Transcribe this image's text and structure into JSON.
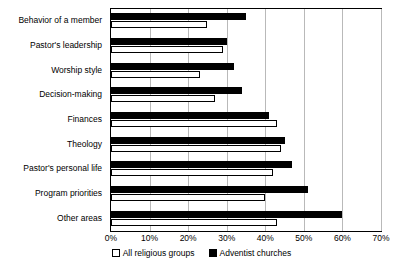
{
  "chart_data": {
    "type": "bar",
    "title": "",
    "xlabel": "",
    "ylabel": "",
    "orientation": "horizontal",
    "grid": true,
    "legend_position": "bottom",
    "xlim": [
      0,
      70
    ],
    "xticks": [
      "0%",
      "10%",
      "20%",
      "30%",
      "40%",
      "50%",
      "60%",
      "70%"
    ],
    "xtick_values": [
      0,
      10,
      20,
      30,
      40,
      50,
      60,
      70
    ],
    "categories": [
      "Behavior of a member",
      "Pastor's leadership",
      "Worship style",
      "Decision-making",
      "Finances",
      "Theology",
      "Pastor's personal life",
      "Program priorities",
      "Other areas"
    ],
    "series": [
      {
        "name": "All religious groups",
        "color": "#ffffff",
        "values": [
          25,
          29,
          23,
          27,
          43,
          44,
          42,
          40,
          43
        ]
      },
      {
        "name": "Adventist churches",
        "color": "#000000",
        "values": [
          35,
          30,
          32,
          34,
          41,
          45,
          47,
          51,
          60
        ]
      }
    ]
  },
  "legend": {
    "items": [
      {
        "label": "All religious groups",
        "swatch": "all"
      },
      {
        "label": "Adventist churches",
        "swatch": "adv"
      }
    ]
  }
}
